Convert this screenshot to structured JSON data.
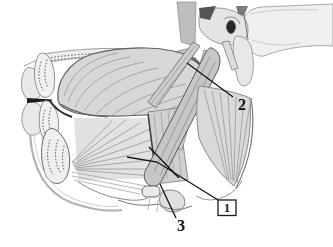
{
  "figure": {
    "alt": "Grayscale sagittal anatomical illustration of the mouth, tongue, mandible and suprahyoid muscle region with three numbered leader-line labels",
    "background": "#ffffff",
    "ink": "#111111",
    "labels": [
      {
        "text": "1",
        "boxed": true
      },
      {
        "text": "2",
        "boxed": false
      },
      {
        "text": "3",
        "boxed": false
      }
    ]
  }
}
